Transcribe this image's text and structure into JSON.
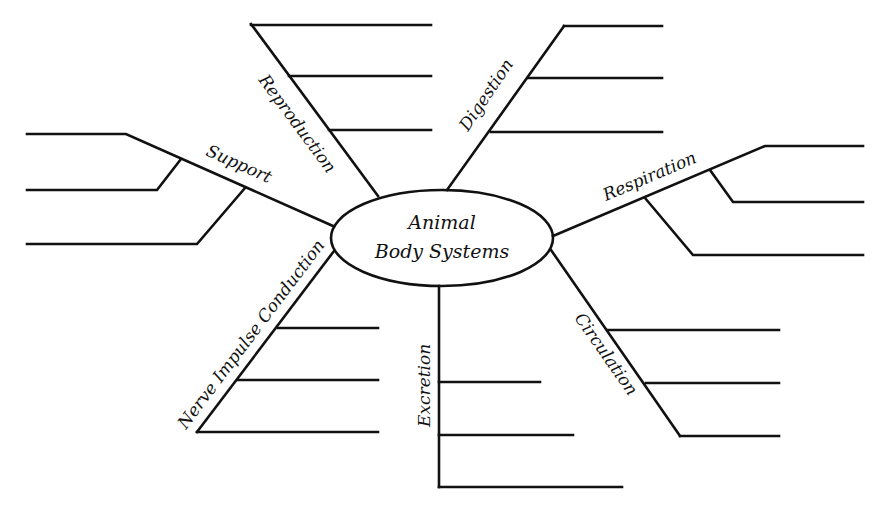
{
  "center": {
    "line1": "Animal",
    "line2": "Body Systems"
  },
  "branches": [
    {
      "id": "reproduction",
      "label": "Reproduction"
    },
    {
      "id": "digestion",
      "label": "Digestion"
    },
    {
      "id": "respiration",
      "label": "Respiration"
    },
    {
      "id": "circulation",
      "label": "Circulation"
    },
    {
      "id": "excretion",
      "label": "Excretion"
    },
    {
      "id": "nerve",
      "label": "Nerve Impulse Conduction"
    },
    {
      "id": "support",
      "label": "Support"
    }
  ],
  "colors": {
    "line": "#111111",
    "background": "#ffffff"
  }
}
